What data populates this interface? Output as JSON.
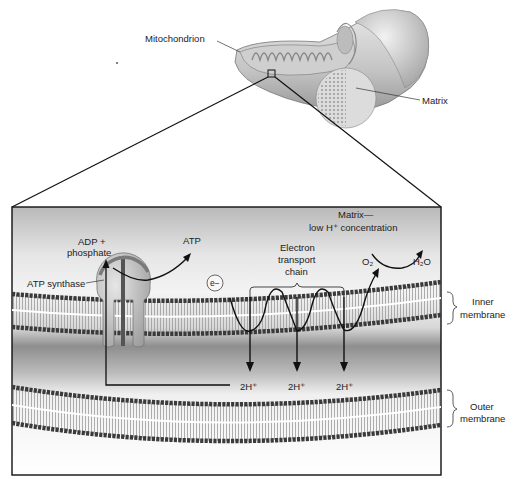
{
  "overview": {
    "mitochondrion_label": "Mitochondrion",
    "matrix_label": "Matrix"
  },
  "detail": {
    "adp_label_line1": "ADP +",
    "adp_label_line2": "phosphate",
    "atp_label": "ATP",
    "atp_synthase_label": "ATP synthase",
    "electron_label": "e−",
    "matrix_note_line1": "Matrix—",
    "matrix_note_line2": "low H⁺ concentration",
    "etc_line1": "Electron",
    "etc_line2": "transport",
    "etc_line3": "chain",
    "o2_label": "O₂",
    "h2o_label": "H₂O",
    "proton_labels": [
      "2H⁺",
      "2H⁺",
      "2H⁺"
    ],
    "inner_membrane_line1": "Inner",
    "inner_membrane_line2": "membrane",
    "outer_membrane_line1": "Outer",
    "outer_membrane_line2": "membrane"
  },
  "colors": {
    "line": "#111111",
    "membrane_head": "#3a3a3a",
    "box_bg_top": "#bdbdbd",
    "box_bg_mid": "#f2f2f2"
  }
}
